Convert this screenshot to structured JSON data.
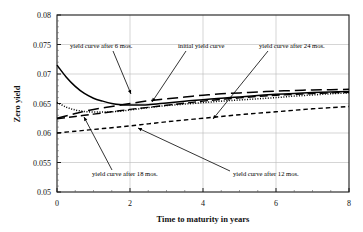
{
  "chart_data": {
    "type": "line",
    "title": "",
    "xlabel": "Time to maturity in years",
    "ylabel": "Zero  yield",
    "xlim": [
      0,
      8
    ],
    "ylim": [
      0.05,
      0.08
    ],
    "xticks": [
      "0",
      "2",
      "4",
      "6",
      "8"
    ],
    "xtick_values": [
      0,
      2,
      4,
      6,
      8
    ],
    "yticks": [
      "0.05",
      "0.055",
      "0.06",
      "0.065",
      "0.07",
      "0.075",
      "0.08"
    ],
    "ytick_values": [
      0.05,
      0.055,
      0.06,
      0.065,
      0.07,
      0.075,
      0.08
    ],
    "grid": true,
    "legend_position": "none",
    "series": [
      {
        "name": "initial yield curve",
        "style": "solid",
        "x": [
          0,
          0.25,
          0.5,
          0.75,
          1.0,
          1.25,
          1.5,
          1.75,
          2.0,
          2.5,
          3.0,
          3.5,
          4.0,
          4.5,
          5.0,
          5.5,
          6.0,
          6.5,
          7.0,
          7.5,
          8.0
        ],
        "y": [
          0.0715,
          0.0695,
          0.0679,
          0.0667,
          0.0659,
          0.0654,
          0.065,
          0.0648,
          0.06475,
          0.0648,
          0.0651,
          0.0654,
          0.06565,
          0.0659,
          0.0661,
          0.06635,
          0.06655,
          0.0667,
          0.06685,
          0.06695,
          0.06705
        ]
      },
      {
        "name": "yield curve after 6 mos.",
        "style": "dotted",
        "x": [
          0,
          0.25,
          0.5,
          0.75,
          1.0,
          1.25,
          1.5,
          1.75,
          2.0,
          2.5,
          3.0,
          3.5,
          4.0,
          4.5,
          5.0,
          5.5,
          6.0,
          6.5,
          7.0,
          7.5,
          8.0
        ],
        "y": [
          0.0652,
          0.0644,
          0.0639,
          0.06365,
          0.06355,
          0.06355,
          0.0636,
          0.0637,
          0.0639,
          0.0643,
          0.06465,
          0.0649,
          0.06515,
          0.0654,
          0.0656,
          0.0658,
          0.066,
          0.06625,
          0.06645,
          0.06665,
          0.0668
        ]
      },
      {
        "name": "yield curve after 12 mos.",
        "style": "dashed-long",
        "x": [
          0,
          0.5,
          1.0,
          1.5,
          2.0,
          2.5,
          3.0,
          3.5,
          4.0,
          4.5,
          5.0,
          5.5,
          6.0,
          6.5,
          7.0,
          7.5,
          8.0
        ],
        "y": [
          0.0624,
          0.0628,
          0.0632,
          0.0636,
          0.064,
          0.06435,
          0.0647,
          0.06505,
          0.0654,
          0.0657,
          0.06595,
          0.0662,
          0.0664,
          0.06655,
          0.0667,
          0.0668,
          0.0669
        ]
      },
      {
        "name": "yield curve after 18 mos.",
        "style": "dashed-short",
        "x": [
          0,
          0.5,
          1.0,
          1.5,
          2.0,
          2.5,
          3.0,
          3.5,
          4.0,
          4.5,
          5.0,
          5.5,
          6.0,
          6.5,
          7.0,
          7.5,
          8.0
        ],
        "y": [
          0.06,
          0.0603,
          0.0606,
          0.0609,
          0.0612,
          0.06155,
          0.0619,
          0.0622,
          0.0625,
          0.0628,
          0.0631,
          0.06335,
          0.0636,
          0.06385,
          0.0641,
          0.0643,
          0.0645
        ]
      },
      {
        "name": "yield curve after 24 mos.",
        "style": "dashed-xlong",
        "x": [
          0,
          0.5,
          1.0,
          1.5,
          2.0,
          2.5,
          3.0,
          3.5,
          4.0,
          4.5,
          5.0,
          5.5,
          6.0,
          6.5,
          7.0,
          7.5,
          8.0
        ],
        "y": [
          0.0625,
          0.0633,
          0.064,
          0.0645,
          0.065,
          0.06545,
          0.0658,
          0.0661,
          0.0664,
          0.06665,
          0.0668,
          0.06695,
          0.0671,
          0.0672,
          0.0673,
          0.06735,
          0.0674
        ]
      }
    ],
    "annotations": [
      {
        "id": "a6",
        "text": "yield curve after 6 mos.",
        "text_x": 70,
        "text_y": 48,
        "leader": [
          [
            113,
            51
          ],
          [
            131,
            94
          ]
        ]
      },
      {
        "id": "a0",
        "text": "initial  yield curve",
        "text_x": 178,
        "text_y": 48,
        "leader": [
          [
            186,
            51
          ],
          [
            152,
            102
          ]
        ]
      },
      {
        "id": "a24",
        "text": "yield curve after 24 mos.",
        "text_x": 259,
        "text_y": 48,
        "leader": [
          [
            268,
            51
          ],
          [
            213,
            119
          ]
        ]
      },
      {
        "id": "a18",
        "text": "yield curve after 18 mos.",
        "text_x": 92,
        "text_y": 176,
        "leader": [
          [
            112,
            170
          ],
          [
            84,
            117
          ]
        ]
      },
      {
        "id": "a12",
        "text": "yield curve after 12 mos.",
        "text_x": 233,
        "text_y": 176,
        "leader": [
          [
            230,
            171
          ],
          [
            138,
            128
          ]
        ]
      }
    ]
  }
}
